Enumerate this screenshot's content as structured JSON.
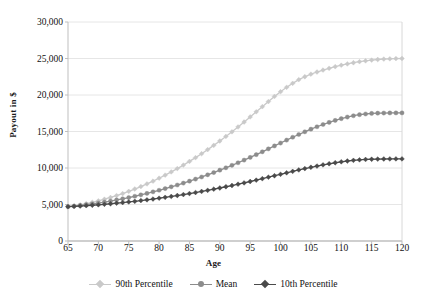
{
  "chart_data": {
    "type": "line",
    "title": "",
    "xlabel": "Age",
    "ylabel": "Payout in $",
    "xlim": [
      65,
      120
    ],
    "ylim": [
      0,
      30000
    ],
    "grid": "horizontal",
    "legend_position": "bottom",
    "x_ticks": [
      "65",
      "70",
      "75",
      "80",
      "85",
      "90",
      "95",
      "100",
      "105",
      "110",
      "115",
      "120"
    ],
    "y_ticks": [
      "0",
      "5,000",
      "10,000",
      "15,000",
      "20,000",
      "25,000",
      "30,000"
    ],
    "x": [
      65,
      66,
      67,
      68,
      69,
      70,
      71,
      72,
      73,
      74,
      75,
      76,
      77,
      78,
      79,
      80,
      81,
      82,
      83,
      84,
      85,
      86,
      87,
      88,
      89,
      90,
      91,
      92,
      93,
      94,
      95,
      96,
      97,
      98,
      99,
      100,
      101,
      102,
      103,
      104,
      105,
      106,
      107,
      108,
      109,
      110,
      111,
      112,
      113,
      114,
      115,
      116,
      117,
      118,
      119,
      120
    ],
    "series": [
      {
        "name": "90th Percentile",
        "color": "#c9c9c9",
        "marker": "diamond",
        "values": [
          4700,
          4820,
          4960,
          5120,
          5300,
          5500,
          5720,
          5960,
          6220,
          6500,
          6800,
          7120,
          7460,
          7820,
          8200,
          8600,
          9020,
          9460,
          9920,
          10400,
          10900,
          11420,
          11960,
          12520,
          13100,
          13700,
          14320,
          14960,
          15620,
          16300,
          17000,
          17700,
          18400,
          19100,
          19800,
          20450,
          21050,
          21600,
          22100,
          22500,
          22850,
          23150,
          23420,
          23660,
          23880,
          24080,
          24260,
          24420,
          24560,
          24680,
          24780,
          24860,
          24920,
          24960,
          24990,
          25000
        ]
      },
      {
        "name": "Mean",
        "color": "#8c8c8c",
        "marker": "circle",
        "values": [
          4700,
          4780,
          4870,
          4970,
          5080,
          5200,
          5330,
          5470,
          5620,
          5780,
          5950,
          6130,
          6320,
          6520,
          6730,
          6950,
          7180,
          7420,
          7670,
          7930,
          8200,
          8480,
          8770,
          9070,
          9380,
          9700,
          10030,
          10370,
          10720,
          11080,
          11450,
          11830,
          12220,
          12620,
          13020,
          13420,
          13820,
          14210,
          14590,
          14960,
          15320,
          15650,
          15960,
          16250,
          16520,
          16760,
          16980,
          17160,
          17300,
          17400,
          17470,
          17510,
          17530,
          17540,
          17545,
          17550
        ]
      },
      {
        "name": "10th Percentile",
        "color": "#4a4a4a",
        "marker": "diamond",
        "values": [
          4700,
          4740,
          4790,
          4840,
          4900,
          4960,
          5030,
          5100,
          5180,
          5260,
          5350,
          5440,
          5540,
          5640,
          5750,
          5860,
          5980,
          6100,
          6230,
          6360,
          6500,
          6640,
          6790,
          6940,
          7100,
          7260,
          7430,
          7600,
          7780,
          7960,
          8150,
          8340,
          8540,
          8740,
          8940,
          9140,
          9340,
          9540,
          9730,
          9920,
          10100,
          10270,
          10430,
          10580,
          10720,
          10850,
          10960,
          11050,
          11120,
          11170,
          11200,
          11220,
          11235,
          11245,
          11250,
          11250
        ]
      }
    ]
  },
  "legend": [
    {
      "label": "90th Percentile"
    },
    {
      "label": "Mean"
    },
    {
      "label": "10th Percentile"
    }
  ]
}
